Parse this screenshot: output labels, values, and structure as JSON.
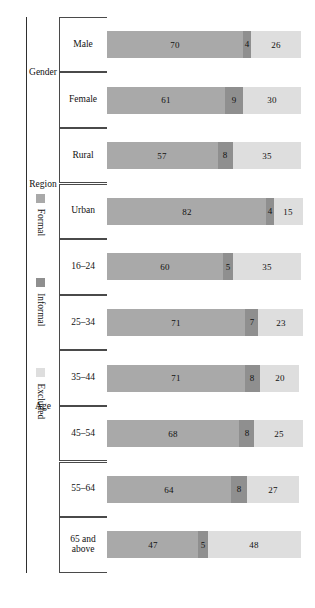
{
  "figure": {
    "orientation": "rotated-90",
    "frame": true
  },
  "colors": {
    "formal": "#a9a9a9",
    "informal": "#8f8f8f",
    "excluded": "#dedede",
    "axis": "#3f3f3f",
    "text": "#111111",
    "frame": "#8d8d8d"
  },
  "legend": {
    "position": "bottom",
    "items": [
      {
        "label": "Formal",
        "color": "#a9a9a9"
      },
      {
        "label": "Informal",
        "color": "#8f8f8f"
      },
      {
        "label": "Excluded",
        "color": "#dedede"
      }
    ]
  },
  "groups": [
    {
      "name": "Gender",
      "categories": [
        "Male",
        "Female"
      ]
    },
    {
      "name": "Region",
      "categories": [
        "Rural",
        "Urban"
      ]
    },
    {
      "name": "Age",
      "categories": [
        "16–24",
        "25–34",
        "35–44",
        "45–54",
        "55–64",
        "65 and\nabove"
      ]
    }
  ],
  "chart_data": {
    "type": "bar",
    "title": "",
    "subtitle": "",
    "xlabel": "",
    "ylabel": "",
    "stacked": true,
    "stack_total": 100,
    "ylim": [
      0,
      100
    ],
    "grid": false,
    "legend_position": "bottom",
    "legend_entries": [
      "Formal",
      "Informal",
      "Excluded"
    ],
    "group_labels": [
      "Gender",
      "Region",
      "Age"
    ],
    "categories": [
      "Male",
      "Female",
      "Rural",
      "Urban",
      "16–24",
      "25–34",
      "35–44",
      "45–54",
      "55–64",
      "65 and above"
    ],
    "category_groups": [
      "Gender",
      "Gender",
      "Region",
      "Region",
      "Age",
      "Age",
      "Age",
      "Age",
      "Age",
      "Age"
    ],
    "series": [
      {
        "name": "Formal",
        "color": "#a9a9a9",
        "values": [
          70,
          61,
          57,
          82,
          60,
          71,
          71,
          68,
          64,
          47
        ]
      },
      {
        "name": "Informal",
        "color": "#8f8f8f",
        "values": [
          4,
          9,
          8,
          4,
          5,
          7,
          8,
          8,
          8,
          5
        ]
      },
      {
        "name": "Excluded",
        "color": "#dedede",
        "values": [
          26,
          30,
          35,
          15,
          35,
          23,
          20,
          25,
          27,
          48
        ]
      }
    ],
    "bar_labels": [
      {
        "category": "Male",
        "Formal": 70,
        "Informal": 4,
        "Excluded": 26
      },
      {
        "category": "Female",
        "Formal": 61,
        "Informal": 9,
        "Excluded": 30
      },
      {
        "category": "Rural",
        "Formal": 57,
        "Informal": 8,
        "Excluded": 35
      },
      {
        "category": "Urban",
        "Formal": 82,
        "Informal": 4,
        "Excluded": 15
      },
      {
        "category": "16–24",
        "Formal": 60,
        "Informal": 5,
        "Excluded": 35
      },
      {
        "category": "25–34",
        "Formal": 71,
        "Informal": 7,
        "Excluded": 23
      },
      {
        "category": "35–44",
        "Formal": 71,
        "Informal": 8,
        "Excluded": 20
      },
      {
        "category": "45–54",
        "Formal": 68,
        "Informal": 8,
        "Excluded": 25
      },
      {
        "category": "55–64",
        "Formal": 64,
        "Informal": 8,
        "Excluded": 27
      },
      {
        "category": "65 and above",
        "Formal": 47,
        "Informal": 5,
        "Excluded": 48
      }
    ]
  }
}
